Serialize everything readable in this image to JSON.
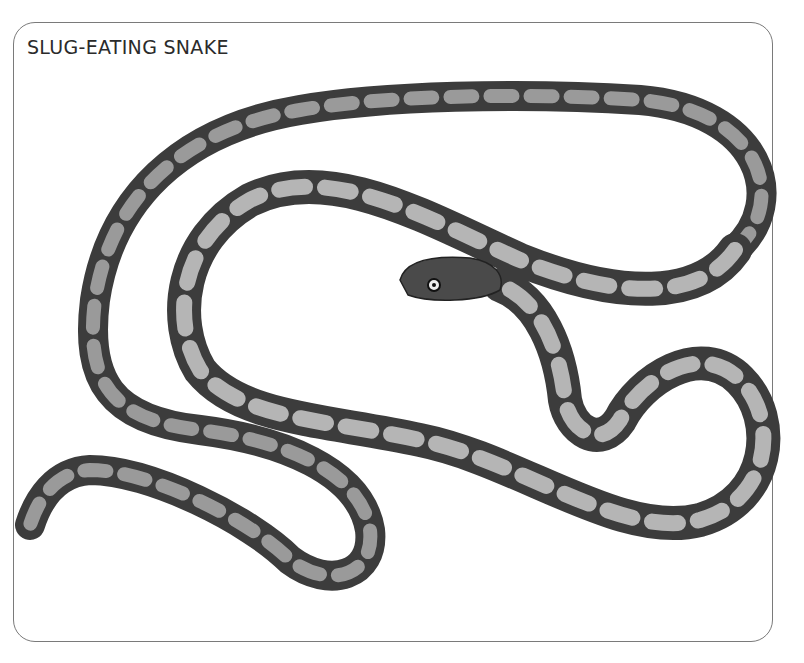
{
  "figure": {
    "title": "SLUG-EATING SNAKE",
    "colors": {
      "border": "#7a7a7a",
      "title": "#2b2b2b",
      "body_dark": "#2e2e2e",
      "body_mid": "#777777",
      "body_light": "#d8d8d8"
    }
  }
}
